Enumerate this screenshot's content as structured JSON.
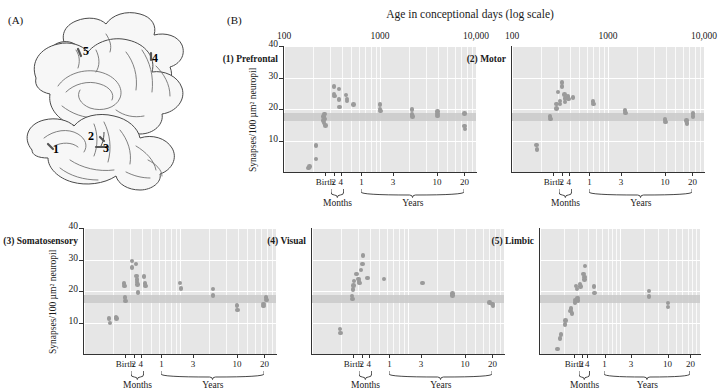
{
  "figure": {
    "panel_a_letter": "(A)",
    "panel_b_letter": "(B)",
    "supertitle": "Age in conceptional days (log scale)"
  },
  "brain": {
    "labels": [
      "1",
      "2",
      "3",
      "4",
      "5"
    ],
    "label_meanings": {
      "1": "Prefrontal",
      "2": "Motor",
      "3": "Somatosensory",
      "4": "Visual",
      "5": "Limbic"
    }
  },
  "axes": {
    "ytitle": "Synapses/100 µm² neuropil",
    "yticks": [
      10,
      20,
      30,
      40
    ],
    "ylim": [
      0,
      40
    ],
    "top_ticks": [
      "100",
      "1000",
      "10,000"
    ],
    "xlim_log": [
      100,
      10000
    ],
    "bottom_ticks": [
      {
        "label": "Birth",
        "days": 267
      },
      {
        "label": "2",
        "days": 330
      },
      {
        "label": "4",
        "days": 390
      },
      {
        "label": "1",
        "days": 640
      },
      {
        "label": "3",
        "days": 1370
      },
      {
        "label": "10",
        "days": 3930
      },
      {
        "label": "20",
        "days": 7580
      }
    ],
    "group_labels": [
      "Months",
      "Years"
    ],
    "reference_band": [
      16.2,
      18.6
    ]
  },
  "chart_data": [
    {
      "type": "scatter",
      "title": "(1) Prefrontal",
      "xlabel": "Age in conceptional days (log scale)",
      "ylabel": "Synapses/100 µm² neuropil",
      "xlim": [
        100,
        10000
      ],
      "ylim": [
        0,
        40
      ],
      "xscale": "log",
      "grid": true,
      "points": [
        {
          "x": 180,
          "y": 1.2
        },
        {
          "x": 185,
          "y": 1.8
        },
        {
          "x": 215,
          "y": 8.4
        },
        {
          "x": 215,
          "y": 4.2
        },
        {
          "x": 258,
          "y": 17.6
        },
        {
          "x": 258,
          "y": 16.4
        },
        {
          "x": 262,
          "y": 15.6
        },
        {
          "x": 265,
          "y": 18.4
        },
        {
          "x": 268,
          "y": 16.8
        },
        {
          "x": 272,
          "y": 14.8
        },
        {
          "x": 330,
          "y": 27.2
        },
        {
          "x": 333,
          "y": 24.8
        },
        {
          "x": 336,
          "y": 24.2
        },
        {
          "x": 372,
          "y": 26.4
        },
        {
          "x": 376,
          "y": 23.0
        },
        {
          "x": 380,
          "y": 20.6
        },
        {
          "x": 440,
          "y": 24.4
        },
        {
          "x": 452,
          "y": 23.2
        },
        {
          "x": 455,
          "y": 22.6
        },
        {
          "x": 530,
          "y": 21.4
        },
        {
          "x": 1000,
          "y": 21.4
        },
        {
          "x": 1005,
          "y": 20.0
        },
        {
          "x": 1010,
          "y": 19.4
        },
        {
          "x": 2150,
          "y": 19.8
        },
        {
          "x": 2160,
          "y": 18.2
        },
        {
          "x": 2170,
          "y": 17.6
        },
        {
          "x": 3950,
          "y": 19.2
        },
        {
          "x": 3960,
          "y": 18.4
        },
        {
          "x": 3970,
          "y": 17.8
        },
        {
          "x": 7600,
          "y": 18.6
        },
        {
          "x": 7620,
          "y": 14.6
        },
        {
          "x": 7640,
          "y": 13.6
        }
      ]
    },
    {
      "type": "scatter",
      "title": "(2) Motor",
      "xlabel": "Age in conceptional days (log scale)",
      "ylabel": "Synapses/100 µm² neuropil",
      "xlim": [
        100,
        10000
      ],
      "ylim": [
        0,
        40
      ],
      "xscale": "log",
      "grid": true,
      "points": [
        {
          "x": 180,
          "y": 8.6
        },
        {
          "x": 182,
          "y": 7.2
        },
        {
          "x": 250,
          "y": 17.6
        },
        {
          "x": 253,
          "y": 16.8
        },
        {
          "x": 290,
          "y": 21.6
        },
        {
          "x": 292,
          "y": 20.2
        },
        {
          "x": 300,
          "y": 25.4
        },
        {
          "x": 315,
          "y": 22.6
        },
        {
          "x": 318,
          "y": 21.6
        },
        {
          "x": 330,
          "y": 28.4
        },
        {
          "x": 333,
          "y": 27.2
        },
        {
          "x": 352,
          "y": 24.6
        },
        {
          "x": 356,
          "y": 23.4
        },
        {
          "x": 358,
          "y": 22.2
        },
        {
          "x": 385,
          "y": 24.0
        },
        {
          "x": 390,
          "y": 23.2
        },
        {
          "x": 430,
          "y": 23.6
        },
        {
          "x": 700,
          "y": 22.4
        },
        {
          "x": 705,
          "y": 21.6
        },
        {
          "x": 1500,
          "y": 19.6
        },
        {
          "x": 1520,
          "y": 18.8
        },
        {
          "x": 3930,
          "y": 16.6
        },
        {
          "x": 3950,
          "y": 15.8
        },
        {
          "x": 6600,
          "y": 16.4
        },
        {
          "x": 6620,
          "y": 15.4
        },
        {
          "x": 7700,
          "y": 18.6
        },
        {
          "x": 7720,
          "y": 17.6
        }
      ]
    },
    {
      "type": "scatter",
      "title": "(3) Somatosensory",
      "xlabel": "Age in conceptional days (log scale)",
      "ylabel": "Synapses/100 µm² neuropil",
      "xlim": [
        100,
        10000
      ],
      "ylim": [
        0,
        40
      ],
      "xscale": "log",
      "grid": true,
      "points": [
        {
          "x": 183,
          "y": 11.2
        },
        {
          "x": 186,
          "y": 9.8
        },
        {
          "x": 215,
          "y": 11.8
        },
        {
          "x": 218,
          "y": 11.2
        },
        {
          "x": 262,
          "y": 22.4
        },
        {
          "x": 265,
          "y": 21.6
        },
        {
          "x": 268,
          "y": 18.0
        },
        {
          "x": 270,
          "y": 16.8
        },
        {
          "x": 315,
          "y": 29.6
        },
        {
          "x": 318,
          "y": 27.4
        },
        {
          "x": 348,
          "y": 28.6
        },
        {
          "x": 352,
          "y": 24.8
        },
        {
          "x": 356,
          "y": 23.6
        },
        {
          "x": 358,
          "y": 22.8
        },
        {
          "x": 362,
          "y": 22.0
        },
        {
          "x": 366,
          "y": 19.6
        },
        {
          "x": 420,
          "y": 24.6
        },
        {
          "x": 430,
          "y": 22.4
        },
        {
          "x": 435,
          "y": 21.6
        },
        {
          "x": 1000,
          "y": 22.6
        },
        {
          "x": 1020,
          "y": 20.8
        },
        {
          "x": 2200,
          "y": 20.6
        },
        {
          "x": 2220,
          "y": 18.6
        },
        {
          "x": 3930,
          "y": 15.4
        },
        {
          "x": 3950,
          "y": 14.0
        },
        {
          "x": 7400,
          "y": 15.8
        },
        {
          "x": 7420,
          "y": 15.2
        },
        {
          "x": 7900,
          "y": 18.0
        },
        {
          "x": 7920,
          "y": 17.2
        }
      ]
    },
    {
      "type": "scatter",
      "title": "(4) Visual",
      "xlabel": "Age in conceptional days (log scale)",
      "ylabel": "Synapses/100 µm² neuropil",
      "xlim": [
        100,
        10000
      ],
      "ylim": [
        0,
        40
      ],
      "xscale": "log",
      "grid": true,
      "points": [
        {
          "x": 195,
          "y": 8.0
        },
        {
          "x": 197,
          "y": 6.6
        },
        {
          "x": 262,
          "y": 18.4
        },
        {
          "x": 264,
          "y": 17.4
        },
        {
          "x": 268,
          "y": 20.4
        },
        {
          "x": 270,
          "y": 21.8
        },
        {
          "x": 274,
          "y": 23.2
        },
        {
          "x": 290,
          "y": 25.4
        },
        {
          "x": 305,
          "y": 23.8
        },
        {
          "x": 310,
          "y": 23.0
        },
        {
          "x": 312,
          "y": 22.6
        },
        {
          "x": 322,
          "y": 26.6
        },
        {
          "x": 336,
          "y": 28.6
        },
        {
          "x": 338,
          "y": 31.2
        },
        {
          "x": 380,
          "y": 24.2
        },
        {
          "x": 560,
          "y": 23.8
        },
        {
          "x": 1420,
          "y": 22.6
        },
        {
          "x": 2900,
          "y": 19.2
        },
        {
          "x": 2920,
          "y": 18.6
        },
        {
          "x": 7100,
          "y": 16.4
        },
        {
          "x": 7600,
          "y": 15.8
        },
        {
          "x": 7650,
          "y": 15.2
        }
      ]
    },
    {
      "type": "scatter",
      "title": "(5) Limbic",
      "xlabel": "Age in conceptional days (log scale)",
      "ylabel": "Synapses/100 µm² neuropil",
      "xlim": [
        100,
        10000
      ],
      "ylim": [
        0,
        40
      ],
      "xscale": "log",
      "grid": true,
      "points": [
        {
          "x": 165,
          "y": 1.6
        },
        {
          "x": 178,
          "y": 5.0
        },
        {
          "x": 182,
          "y": 6.2
        },
        {
          "x": 205,
          "y": 9.4
        },
        {
          "x": 208,
          "y": 10.6
        },
        {
          "x": 240,
          "y": 13.6
        },
        {
          "x": 245,
          "y": 14.4
        },
        {
          "x": 252,
          "y": 12.8
        },
        {
          "x": 272,
          "y": 16.4
        },
        {
          "x": 276,
          "y": 17.2
        },
        {
          "x": 280,
          "y": 21.6
        },
        {
          "x": 290,
          "y": 20.6
        },
        {
          "x": 296,
          "y": 17.8
        },
        {
          "x": 300,
          "y": 17.0
        },
        {
          "x": 318,
          "y": 22.2
        },
        {
          "x": 322,
          "y": 21.4
        },
        {
          "x": 350,
          "y": 25.4
        },
        {
          "x": 358,
          "y": 24.4
        },
        {
          "x": 362,
          "y": 23.6
        },
        {
          "x": 366,
          "y": 28.0
        },
        {
          "x": 470,
          "y": 21.4
        },
        {
          "x": 480,
          "y": 19.4
        },
        {
          "x": 2300,
          "y": 20.0
        },
        {
          "x": 2320,
          "y": 18.2
        },
        {
          "x": 3980,
          "y": 16.2
        },
        {
          "x": 4000,
          "y": 15.0
        }
      ]
    }
  ],
  "colors": {
    "plot_background": "#e6e6e6",
    "gridline": "#ffffff",
    "dot": "#9a9a9a",
    "reference_band": "#c9c9c9",
    "axis": "#333333",
    "text": "#1a1a1a"
  }
}
